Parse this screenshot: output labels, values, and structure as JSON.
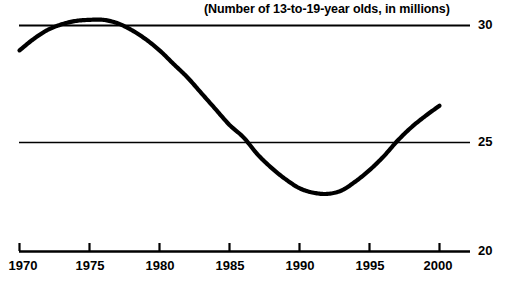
{
  "chart_data": {
    "type": "line",
    "title": "(Number of 13-to-19-year olds, in millions)",
    "xlabel": "",
    "ylabel": "",
    "xlim": [
      1970,
      2000
    ],
    "ylim": [
      20,
      30
    ],
    "grid": true,
    "gridlines_y": [
      25,
      30
    ],
    "legend": null,
    "xticks": [
      1970,
      1975,
      1980,
      1985,
      1990,
      1995,
      2000
    ],
    "xtick_labels": [
      "1970",
      "1975",
      "1980",
      "1985",
      "1990",
      "1995",
      "2000"
    ],
    "yticks": [
      20,
      25,
      30
    ],
    "ytick_labels": [
      "20",
      "25",
      "30"
    ],
    "series": [
      {
        "name": "13-to-19-year olds",
        "color": "#000000",
        "x": [
          1970,
          1971,
          1972,
          1973,
          1974,
          1975,
          1976,
          1977,
          1978,
          1979,
          1980,
          1981,
          1982,
          1983,
          1984,
          1985,
          1986,
          1987,
          1988,
          1989,
          1990,
          1991,
          1992,
          1993,
          1994,
          1995,
          1996,
          1997,
          1998,
          1999,
          2000
        ],
        "values": [
          28.9,
          29.4,
          29.8,
          30.05,
          30.2,
          30.25,
          30.25,
          30.1,
          29.8,
          29.4,
          28.9,
          28.3,
          27.7,
          27.0,
          26.3,
          25.6,
          25.05,
          24.3,
          23.7,
          23.2,
          22.8,
          22.6,
          22.55,
          22.7,
          23.1,
          23.6,
          24.2,
          24.9,
          25.5,
          26.0,
          26.45
        ]
      }
    ],
    "annotations": []
  },
  "axis": {
    "y_labels": {
      "top": "30",
      "middle": "25",
      "bottom": "20"
    }
  },
  "caption": ""
}
